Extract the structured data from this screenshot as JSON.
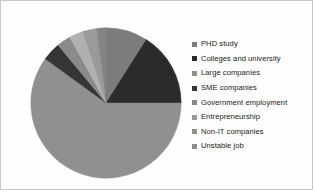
{
  "chart_data": {
    "type": "pie",
    "title": "",
    "legend_position": "right",
    "start_angle_deg": 0,
    "direction": "clockwise",
    "categories": [
      "PHD study",
      "Colleges and university",
      "Large companies",
      "SME companies",
      "Government employment",
      "Entrepreneurship",
      "Non-IT companies",
      "Unstable job"
    ],
    "values": [
      9,
      16,
      60,
      4,
      3,
      3,
      3,
      2
    ],
    "units": "percent",
    "slices": [
      {
        "label": "PHD study",
        "value": 9,
        "color": "#7c7c7c",
        "start_deg": 0,
        "end_deg": 32.4
      },
      {
        "label": "Colleges and university",
        "value": 16,
        "color": "#2b2b2b",
        "start_deg": 32.4,
        "end_deg": 90.0
      },
      {
        "label": "Large companies",
        "value": 60,
        "color": "#909090",
        "start_deg": 90.0,
        "end_deg": 306.0
      },
      {
        "label": "SME companies",
        "value": 4,
        "color": "#353535",
        "start_deg": 306.0,
        "end_deg": 320.4
      },
      {
        "label": "Government employment",
        "value": 3,
        "color": "#8a8a8a",
        "start_deg": 320.4,
        "end_deg": 331.2
      },
      {
        "label": "Entrepreneurship",
        "value": 3,
        "color": "#b0b0b0",
        "start_deg": 331.2,
        "end_deg": 342.0
      },
      {
        "label": "Non-IT companies",
        "value": 3,
        "color": "#9a9a9a",
        "start_deg": 342.0,
        "end_deg": 352.8
      },
      {
        "label": "Unstable job",
        "value": 2,
        "color": "#848484",
        "start_deg": 352.8,
        "end_deg": 360.0
      }
    ]
  },
  "legend": {
    "items": [
      {
        "label": "PHD study",
        "color": "#7c7c7c"
      },
      {
        "label": "Colleges and university",
        "color": "#2b2b2b"
      },
      {
        "label": "Large companies",
        "color": "#909090"
      },
      {
        "label": "SME companies",
        "color": "#353535"
      },
      {
        "label": "Government employment",
        "color": "#8a8a8a"
      },
      {
        "label": "Entrepreneurship",
        "color": "#9a9a9a"
      },
      {
        "label": "Non-IT companies",
        "color": "#8f8f8f"
      },
      {
        "label": "Unstable job",
        "color": "#8a8a8a"
      }
    ]
  }
}
